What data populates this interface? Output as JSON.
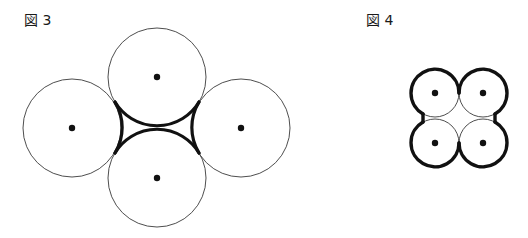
{
  "figures": [
    {
      "label": "図 3",
      "circles": [
        {
          "id": "top",
          "cx": 157,
          "cy": 77,
          "r": 49
        },
        {
          "id": "left",
          "cx": 72,
          "cy": 128,
          "r": 49
        },
        {
          "id": "right",
          "cx": 241,
          "cy": 128,
          "r": 49
        },
        {
          "id": "bottom",
          "cx": 157,
          "cy": 178,
          "r": 49
        }
      ],
      "highlight": "inner concave region bounded by the four circles drawn in bold"
    },
    {
      "label": "図 4",
      "circles": [
        {
          "id": "top-left",
          "cx": 435,
          "cy": 93,
          "r": 24
        },
        {
          "id": "top-right",
          "cx": 483,
          "cy": 93,
          "r": 24
        },
        {
          "id": "bottom-left",
          "cx": 435,
          "cy": 143,
          "r": 24
        },
        {
          "id": "bottom-right",
          "cx": 483,
          "cy": 143,
          "r": 24
        }
      ],
      "highlight": "outer perimeter of the four-circle cluster drawn in bold"
    }
  ],
  "colors": {
    "line": "#2a2a2a",
    "bold": "#111111",
    "dot": "#111111"
  }
}
